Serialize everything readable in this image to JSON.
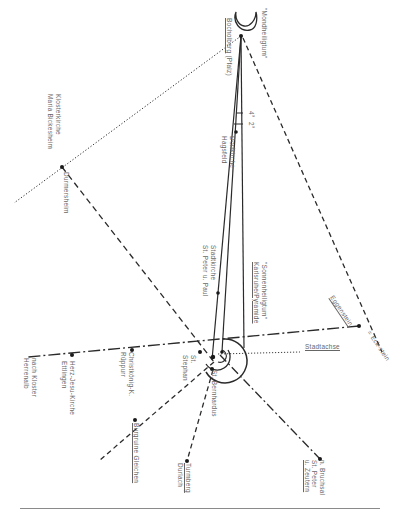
{
  "diagram": {
    "type": "alignment-map",
    "orientation": "rotated 90° (text runs top-to-bottom)",
    "center": "Karlsruhe",
    "angles": [
      "4°",
      "2°"
    ],
    "labels": {
      "mondheiligtum": "\"Mondheiligtum\"",
      "bocholberg": "Bocholberg",
      "bocholberg_region": "(Pfalz)",
      "klosterkirche_1": "Klosterkirche",
      "klosterkirche_2": "Maria Bickesheim",
      "durmersheim": "Durmersheim",
      "dorfkirche_1": "Dorfkirche",
      "dorfkirche_2": "Hagsfeld",
      "stadtkirche_1": "Stadtkirche",
      "stadtkirche_2": "St. Peter u. Paul",
      "sonnen_1": "\"Sonnenheiligtum\"",
      "sonnen_2": "Karlsruhe/Pyramide",
      "eggenstein": "Eggenstein",
      "eckstein": "= Eck-stein",
      "stadtachse": "Stadtachse",
      "st_stephan_1": "St.",
      "st_stephan_2": "Stephan",
      "st_bernhardus": "St. Bernhardus",
      "herrenalb_1": "nach Kloster",
      "herrenalb_2": "Herrenalb",
      "herzjesu_1": "Herz-Jesu-Kirche",
      "herzjesu_2": "Ettlingen",
      "christkoenig_1": "Christkönig-K.",
      "christkoenig_2": "Rüppurr",
      "burgruine": "Burgruine Gleichen",
      "turmberg_1": "Turmberg",
      "turmberg_2": "Durlach",
      "bruchsal_1": "n. Bruchsal",
      "bruchsal_2": "St. Peter",
      "bruchsal_3": "u. Zeutern"
    },
    "colors": {
      "line": "#2a2a2a",
      "text": "#666666",
      "rule": "#8a8a8a"
    }
  }
}
